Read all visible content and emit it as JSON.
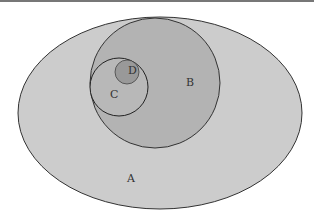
{
  "diagram": {
    "type": "euler",
    "sets": [
      {
        "label": "A",
        "shape": "ellipse",
        "fill": "#cccccc"
      },
      {
        "label": "B",
        "shape": "circle",
        "fill": "#b3b3b3"
      },
      {
        "label": "C",
        "shape": "circle",
        "fill": "#b8b8b8"
      },
      {
        "label": "D",
        "shape": "circle",
        "fill": "#9a9a9a"
      }
    ],
    "relations": [
      "D ⊂ C",
      "C ⊂ B",
      "B ⊂ A"
    ]
  }
}
